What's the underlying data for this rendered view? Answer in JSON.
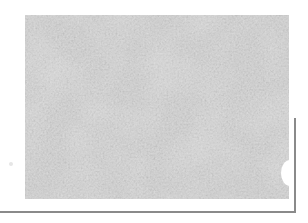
{
  "image": {
    "description": "Grayscale micrograph of densely packed cells with a thin gray frame line along the bottom and lower right edge",
    "colors": {
      "background": "#ffffff",
      "texture_mid": "#a4a4a4",
      "texture_dark": "#5e5e5e",
      "texture_light": "#e0e0e0",
      "frame_line": "#8a8a8a"
    }
  }
}
